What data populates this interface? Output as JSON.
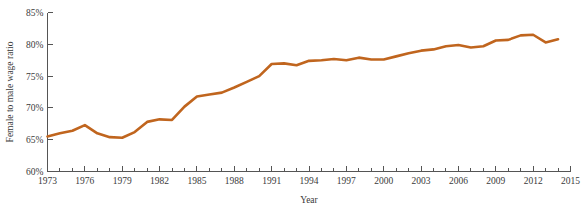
{
  "chart_data": {
    "type": "line",
    "title": "",
    "xlabel": "Year",
    "ylabel": "Female to male wage ratio",
    "xlim": [
      1973,
      2015
    ],
    "ylim": [
      60,
      85
    ],
    "grid": false,
    "legend": null,
    "line_color": "#C0651E",
    "axis_color": "#555555",
    "y_tick_labels": [
      "85%",
      "80%",
      "75%",
      "70%",
      "65%",
      "60%"
    ],
    "y_tick_values": [
      85,
      80,
      75,
      70,
      65,
      60
    ],
    "x_tick_labels": [
      "1973",
      "1976",
      "1979",
      "1982",
      "1985",
      "1988",
      "1991",
      "1994",
      "1997",
      "2000",
      "2003",
      "2006",
      "2009",
      "2012",
      "2015"
    ],
    "x_tick_values": [
      1973,
      1976,
      1979,
      1982,
      1985,
      1988,
      1991,
      1994,
      1997,
      2000,
      2003,
      2006,
      2009,
      2012,
      2015
    ],
    "x_minor_tick_values": [
      1974,
      1975,
      1977,
      1978,
      1980,
      1981,
      1983,
      1984,
      1986,
      1987,
      1989,
      1990,
      1992,
      1993,
      1995,
      1996,
      1998,
      1999,
      2001,
      2002,
      2004,
      2005,
      2007,
      2008,
      2010,
      2011,
      2013,
      2014
    ],
    "x": [
      1973,
      1974,
      1975,
      1976,
      1977,
      1978,
      1979,
      1980,
      1981,
      1982,
      1983,
      1984,
      1985,
      1986,
      1987,
      1988,
      1989,
      1990,
      1991,
      1992,
      1993,
      1994,
      1995,
      1996,
      1997,
      1998,
      1999,
      2000,
      2001,
      2002,
      2003,
      2004,
      2005,
      2006,
      2007,
      2008,
      2009,
      2010,
      2011,
      2012,
      2013,
      2014
    ],
    "values": [
      65.5,
      66.0,
      66.4,
      67.3,
      66.0,
      65.4,
      65.3,
      66.2,
      67.8,
      68.2,
      68.1,
      70.2,
      71.8,
      72.1,
      72.4,
      73.2,
      74.1,
      75.0,
      76.9,
      77.0,
      76.7,
      77.4,
      77.5,
      77.7,
      77.5,
      77.9,
      77.6,
      77.6,
      78.1,
      78.6,
      79.0,
      79.2,
      79.7,
      79.9,
      79.5,
      79.7,
      80.6,
      80.7,
      81.4,
      81.5,
      80.3,
      80.8
    ],
    "series": [
      {
        "name": "Female to male wage ratio",
        "color": "#C0651E",
        "values": [
          65.5,
          66.0,
          66.4,
          67.3,
          66.0,
          65.4,
          65.3,
          66.2,
          67.8,
          68.2,
          68.1,
          70.2,
          71.8,
          72.1,
          72.4,
          73.2,
          74.1,
          75.0,
          76.9,
          77.0,
          76.7,
          77.4,
          77.5,
          77.7,
          77.5,
          77.9,
          77.6,
          77.6,
          78.1,
          78.6,
          79.0,
          79.2,
          79.7,
          79.9,
          79.5,
          79.7,
          80.6,
          80.7,
          81.4,
          81.5,
          80.3,
          80.8
        ]
      }
    ]
  }
}
